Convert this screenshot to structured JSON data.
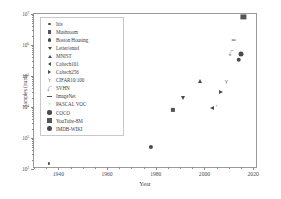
{
  "chart_data": {
    "type": "scatter",
    "title": "",
    "xlabel": "Year",
    "ylabel": "Samples (num)",
    "xlim": [
      1930,
      2022
    ],
    "ylim_log10": [
      2,
      7
    ],
    "yscale": "log",
    "xscale": "linear",
    "grid": false,
    "legend_position": "upper left",
    "xticks": [
      "1940",
      "1960",
      "1980",
      "2000",
      "2020"
    ],
    "xtick_values": [
      1940,
      1960,
      1980,
      2000,
      2020
    ],
    "ytick_labels": [
      "10²",
      "10³",
      "10⁴",
      "10⁵",
      "10⁶",
      "10⁷"
    ],
    "ytick_exponents": [
      2,
      3,
      4,
      5,
      6,
      7
    ],
    "points": [
      {
        "name": "Iris",
        "year": 1936,
        "samples": 150,
        "log10": 2.18,
        "marker": "dot"
      },
      {
        "name": "Mushroom",
        "year": 1987,
        "samples": 8124,
        "log10": 3.91,
        "marker": "square"
      },
      {
        "name": "Boston Housing",
        "year": 1978,
        "samples": 506,
        "log10": 2.7,
        "marker": "circle"
      },
      {
        "name": "Letter",
        "year": 1991,
        "samples": 20000,
        "log10": 4.3,
        "marker": "tri-down"
      },
      {
        "name": "MNIST",
        "year": 1998,
        "samples": 70000,
        "log10": 4.85,
        "marker": "tri-up"
      },
      {
        "name": "Caltech101",
        "year": 2003,
        "samples": 9146,
        "log10": 3.96,
        "marker": "tri-left"
      },
      {
        "name": "Caltech256",
        "year": 2007,
        "samples": 30607,
        "log10": 4.49,
        "marker": "tri-right"
      },
      {
        "name": "CIFAR10/100",
        "year": 2009,
        "samples": 60000,
        "log10": 4.78,
        "marker": "tri-y"
      },
      {
        "name": "SVHN",
        "year": 2011,
        "samples": 600000,
        "log10": 5.78,
        "marker": "tri-thin"
      },
      {
        "name": "ImageNet",
        "year": 2012,
        "samples": 14000000,
        "log10": 6.15,
        "marker": "hline"
      },
      {
        "name": "PASCAL VOC",
        "year": 2005,
        "samples": 11540,
        "log10": 4.06,
        "marker": "caret-right"
      },
      {
        "name": "COCO",
        "year": 2014,
        "samples": 330000,
        "log10": 5.52,
        "marker": "circle-filled"
      },
      {
        "name": "YouTube-8M",
        "year": 2016,
        "samples": 8000000,
        "log10": 6.9,
        "marker": "square-filled"
      },
      {
        "name": "IMDB-WIKI",
        "year": 2015,
        "samples": 523051,
        "log10": 5.72,
        "marker": "circle-big"
      }
    ]
  },
  "legend": {
    "items": [
      {
        "label": "Iris",
        "marker": "dot"
      },
      {
        "label": "Mushroom",
        "marker": "square"
      },
      {
        "label": "Boston Housing",
        "marker": "circle"
      },
      {
        "label": "Letter/enud",
        "marker": "tri-down"
      },
      {
        "label": "MNIST",
        "marker": "tri-up"
      },
      {
        "label": "Caltech101",
        "marker": "tri-left"
      },
      {
        "label": "Caltech256",
        "marker": "tri-right"
      },
      {
        "label": "CIFAR10/100",
        "marker": "tri-y"
      },
      {
        "label": "SVHN",
        "marker": "tri-thin"
      },
      {
        "label": "ImageNet",
        "marker": "hline"
      },
      {
        "label": "PASCAL VOC",
        "marker": "caret-right"
      },
      {
        "label": "COCO",
        "marker": "circle-filled"
      },
      {
        "label": "YouTube-8M",
        "marker": "square-filled"
      },
      {
        "label": "IMDB-WIKI",
        "marker": "circle-big"
      }
    ]
  },
  "colors": {
    "marker": "#4a4a4a",
    "axis": "#9a9a9a",
    "text": "#3c3c3c",
    "background": "#ffffff"
  }
}
